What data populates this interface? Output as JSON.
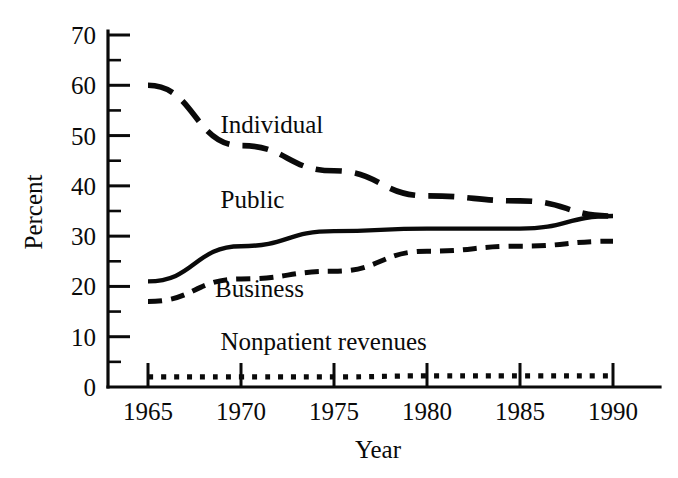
{
  "chart_data": {
    "type": "line",
    "title": "",
    "xlabel": "Year",
    "ylabel": "Percent",
    "x": [
      1965,
      1970,
      1975,
      1980,
      1985,
      1990
    ],
    "xlim": [
      1965,
      1990
    ],
    "ylim": [
      0,
      70
    ],
    "grid": false,
    "legend_position": "inline-annotations",
    "x_tick_labels": [
      "1965",
      "1970",
      "1975",
      "1980",
      "1985",
      "1990"
    ],
    "y_tick_labels": [
      "0",
      "10",
      "20",
      "30",
      "40",
      "50",
      "60",
      "70"
    ],
    "y_ticks": [
      0,
      10,
      20,
      30,
      40,
      50,
      60,
      70
    ],
    "y_minor_ticks": [
      5,
      15,
      25,
      35,
      45,
      55,
      65
    ],
    "series": [
      {
        "name": "Individual",
        "style": "long-dash",
        "values": [
          60,
          48,
          43,
          38,
          37,
          34
        ],
        "label": "Individual",
        "label_x": 1968.9,
        "label_y": 50.5
      },
      {
        "name": "Public",
        "style": "solid",
        "values": [
          21,
          28,
          31,
          31.5,
          31.5,
          34
        ],
        "label": "Public",
        "label_x": 1968.9,
        "label_y": 35.5
      },
      {
        "name": "Business",
        "style": "short-dash",
        "values": [
          17,
          21.5,
          23,
          27,
          28,
          29
        ],
        "label": "Business",
        "label_x": 1968.6,
        "label_y": 17.8
      },
      {
        "name": "Nonpatient revenues",
        "style": "dotted",
        "values": [
          2,
          2,
          2,
          2.2,
          2.2,
          2.2
        ],
        "label": "Nonpatient revenues",
        "label_x": 1968.9,
        "label_y": 7.3
      }
    ],
    "colors": {
      "ink": "#0a0a0a",
      "background": "#ffffff"
    }
  }
}
